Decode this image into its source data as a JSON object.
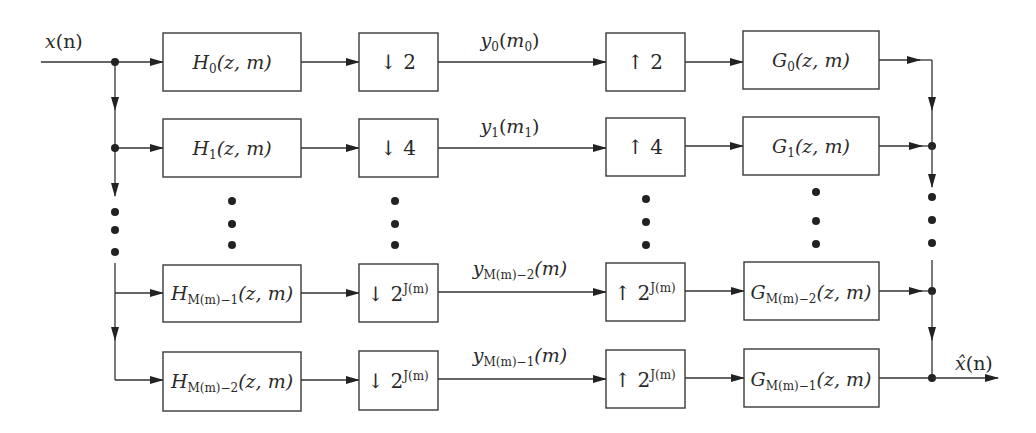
{
  "diagram": {
    "input_label": {
      "var": "x",
      "arg": "(n)"
    },
    "output_label": {
      "var": "x̂",
      "arg": "(n)"
    },
    "rows": [
      {
        "analysis": {
          "name": "H",
          "sub": "0",
          "args": "(z, m)"
        },
        "down": {
          "arrow": "↓",
          "base": "2",
          "exp": ""
        },
        "signal": {
          "name": "y",
          "sub": "0",
          "args_var": "m",
          "args_sub": "0"
        },
        "up": {
          "arrow": "↑",
          "base": "2",
          "exp": ""
        },
        "synthesis": {
          "name": "G",
          "sub": "0",
          "args": "(z, m)"
        }
      },
      {
        "analysis": {
          "name": "H",
          "sub": "1",
          "args": "(z, m)"
        },
        "down": {
          "arrow": "↓",
          "base": "4",
          "exp": ""
        },
        "signal": {
          "name": "y",
          "sub": "1",
          "args_var": "m",
          "args_sub": "1"
        },
        "up": {
          "arrow": "↑",
          "base": "4",
          "exp": ""
        },
        "synthesis": {
          "name": "G",
          "sub": "1",
          "args": "(z, m)"
        }
      },
      {
        "analysis": {
          "name": "H",
          "sub": "M(m)−1",
          "args": "(z, m)"
        },
        "down": {
          "arrow": "↓",
          "base": "2",
          "exp": "J(m)"
        },
        "signal": {
          "name": "y",
          "sub": "M(m)−2",
          "args": "(m)"
        },
        "up": {
          "arrow": "↑",
          "base": "2",
          "exp": "J(m)"
        },
        "synthesis": {
          "name": "G",
          "sub": "M(m)−2",
          "args": "(z, m)"
        }
      },
      {
        "analysis": {
          "name": "H",
          "sub": "M(m)−2",
          "args": "(z, m)"
        },
        "down": {
          "arrow": "↓",
          "base": "2",
          "exp": "J(m)"
        },
        "signal": {
          "name": "y",
          "sub": "M(m)−1",
          "args": "(m)"
        },
        "up": {
          "arrow": "↑",
          "base": "2",
          "exp": "J(m)"
        },
        "synthesis": {
          "name": "G",
          "sub": "M(m)−1",
          "args": "(z, m)"
        }
      }
    ],
    "ellipsis": "⋮"
  }
}
